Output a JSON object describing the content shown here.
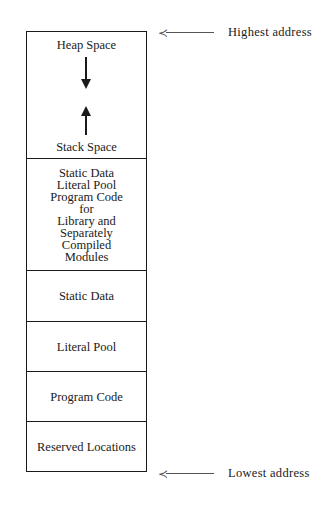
{
  "diagram": {
    "title": "",
    "segments": [
      {
        "id": "heap-stack",
        "top_label": "Heap Space",
        "bottom_label": "Stack Space",
        "arrows": [
          "down",
          "up"
        ]
      },
      {
        "id": "library",
        "lines": [
          "Static Data",
          "Literal Pool",
          "Program Code",
          "for",
          "Library and",
          "Separately",
          "Compiled",
          "Modules"
        ]
      },
      {
        "id": "static-data",
        "label": "Static Data"
      },
      {
        "id": "literal-pool",
        "label": "Literal Pool"
      },
      {
        "id": "program-code",
        "label": "Program Code"
      },
      {
        "id": "reserved",
        "label": "Reserved Locations"
      }
    ],
    "pointers": {
      "top": {
        "label": "Highest address",
        "arrow_glyph": "≺"
      },
      "bottom": {
        "label": "Lowest address",
        "arrow_glyph": "≺"
      }
    }
  }
}
